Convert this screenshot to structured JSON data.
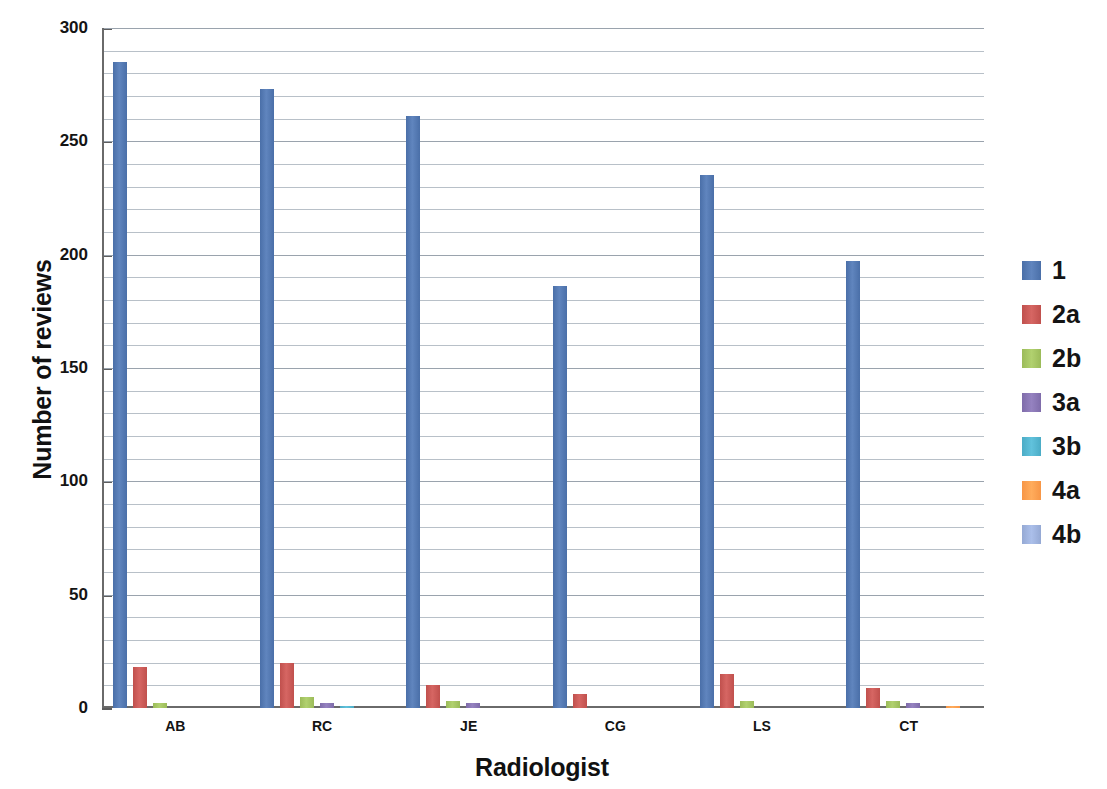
{
  "chart_data": {
    "type": "bar",
    "title": "",
    "xlabel": "Radiologist",
    "ylabel": "Number of reviews",
    "categories": [
      "AB",
      "RC",
      "JE",
      "CG",
      "LS",
      "CT"
    ],
    "ylim": [
      0,
      300
    ],
    "y_ticks_major": [
      0,
      50,
      100,
      150,
      200,
      250,
      300
    ],
    "y_tick_labels": [
      "0",
      "50",
      "100",
      "150",
      "200",
      "250",
      "300"
    ],
    "y_minor_step": 10,
    "grid": true,
    "legend_position": "right",
    "series": [
      {
        "name": "1",
        "color": "#4a6fa8",
        "values": [
          285,
          273,
          261,
          186,
          235,
          197
        ]
      },
      {
        "name": "2a",
        "color": "#c0504d",
        "values": [
          18,
          20,
          10,
          6,
          15,
          9
        ]
      },
      {
        "name": "2b",
        "color": "#9bbb59",
        "values": [
          2,
          5,
          3,
          0,
          3,
          3
        ]
      },
      {
        "name": "3a",
        "color": "#7f6caa",
        "values": [
          0,
          2,
          2,
          0,
          0,
          2
        ]
      },
      {
        "name": "3b",
        "color": "#4bacc6",
        "values": [
          0,
          1,
          0,
          0,
          0,
          0
        ]
      },
      {
        "name": "4a",
        "color": "#f79646",
        "values": [
          0,
          0,
          0,
          0,
          0,
          1
        ]
      },
      {
        "name": "4b",
        "color": "#95a9d4",
        "values": [
          0,
          0,
          0,
          0,
          0,
          0
        ]
      }
    ]
  },
  "legend": {
    "items": [
      {
        "label": "1",
        "color": "#4a6fa8"
      },
      {
        "label": "2a",
        "color": "#c0504d"
      },
      {
        "label": "2b",
        "color": "#9bbb59"
      },
      {
        "label": "3a",
        "color": "#7f6caa"
      },
      {
        "label": "3b",
        "color": "#4bacc6"
      },
      {
        "label": "4a",
        "color": "#f79646"
      },
      {
        "label": "4b",
        "color": "#95a9d4"
      }
    ]
  }
}
